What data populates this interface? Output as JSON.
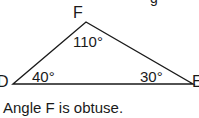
{
  "diagram": {
    "vertices": {
      "F": {
        "label": "F",
        "angle": "110°"
      },
      "D": {
        "label": "D",
        "angle": "40°"
      },
      "E": {
        "label": "E",
        "angle": "30°"
      }
    },
    "partial_top_text": "g",
    "caption": "Angle F is obtuse."
  }
}
